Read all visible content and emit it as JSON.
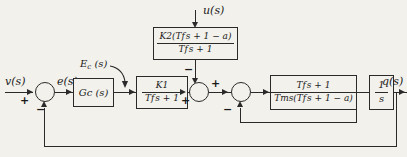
{
  "diagram": {
    "background_color": "#f2f1ec",
    "line_color": "#2a2a2a",
    "signals": {
      "input": "v(s)",
      "error": "e(s)",
      "controller_output": "E",
      "controller_output_sub": "c",
      "controller_output_tail": " (s)",
      "disturbance": "u(s)",
      "output": "q(s)"
    },
    "blocks": {
      "controller": {
        "name": "controller-block",
        "label_main": "G",
        "label_sub": "c",
        "label_tail": " (s)"
      },
      "feedforward": {
        "name": "feedforward-block",
        "numerator_k": "K",
        "numerator_k_sub": "2",
        "numerator_rest": "(T",
        "numerator_t_sub": "f",
        "numerator_tail": "s + 1 − a)",
        "denominator_t": "T",
        "denominator_t_sub": "f",
        "denominator_tail": "s + 1"
      },
      "gain": {
        "name": "gain-block",
        "numerator": "K",
        "numerator_sub": "1",
        "denominator_t": "T",
        "denominator_t_sub": "f",
        "denominator_tail": "s + 1"
      },
      "plant": {
        "name": "plant-block",
        "numerator_t": "T",
        "numerator_t_sub": "f",
        "numerator_tail": "s + 1",
        "denominator_tm": "T",
        "denominator_tm_sub": "m",
        "denominator_mid": "s(T",
        "denominator_t_sub": "f",
        "denominator_tail": "s + 1 − a)"
      },
      "integrator": {
        "name": "integrator-block",
        "numerator": "1",
        "denominator": "s"
      }
    },
    "summing_junctions": [
      {
        "name": "summing-junction-1",
        "signs": {
          "left": "+",
          "bottom": "−"
        }
      },
      {
        "name": "summing-junction-2",
        "signs": {
          "left": "+",
          "top": "−",
          "right": "+"
        }
      },
      {
        "name": "summing-junction-3",
        "signs": {
          "bottom": "−"
        }
      }
    ]
  }
}
